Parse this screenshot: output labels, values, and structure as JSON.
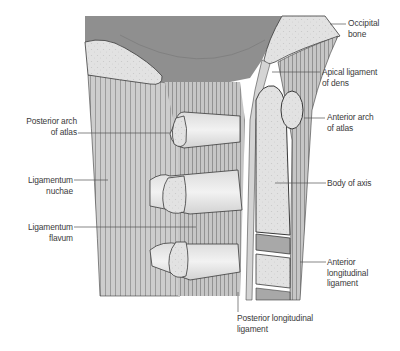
{
  "diagram": {
    "labels": {
      "occipital_bone": {
        "line1": "Occipital",
        "line2": "bone"
      },
      "apical_ligament": {
        "line1": "Apical ligament",
        "line2": "of dens"
      },
      "anterior_arch": {
        "line1": "Anterior arch",
        "line2": "of atlas"
      },
      "body_of_axis": {
        "line1": "Body of axis"
      },
      "anterior_longitudinal": {
        "line1": "Anterior",
        "line2": "longitudinal",
        "line3": "ligament"
      },
      "posterior_longitudinal": {
        "line1": "Posterior longitudinal",
        "line2": "ligament"
      },
      "posterior_arch": {
        "line1": "Posterior arch",
        "line2": "of atlas"
      },
      "ligamentum_nuchae": {
        "line1": "Ligamentum",
        "line2": "nuchae"
      },
      "ligamentum_flavum": {
        "line1": "Ligamentum",
        "line2": "flavum"
      }
    },
    "colors": {
      "skull_cavity": "#8f8f8f",
      "ligament": "#c9c9c9",
      "ligament_line": "#6e6e6e",
      "bone": "#e4e4e4",
      "bone_edge": "#3a3a3a",
      "disc": "#a8a8a8",
      "leader": "#555555"
    }
  }
}
